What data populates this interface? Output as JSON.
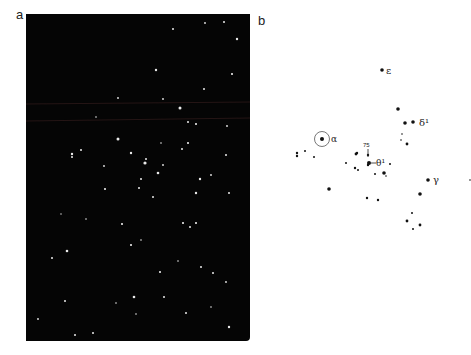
{
  "figure": {
    "panel_a": {
      "label": "a",
      "description": "Photograph of star field (white stars on black background)"
    },
    "panel_b": {
      "label": "b",
      "description": "Star chart with labeled stars",
      "star_labels": {
        "epsilon": "ε",
        "delta1": "δ¹",
        "alpha": "α",
        "theta1": "θ¹",
        "gamma": "γ",
        "num75": "75"
      }
    }
  }
}
